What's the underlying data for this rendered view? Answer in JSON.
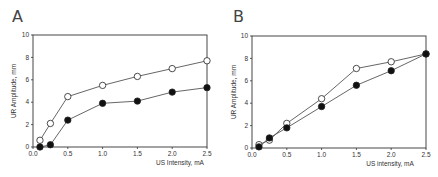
{
  "chart_data": [
    {
      "panel": "A",
      "type": "line",
      "xlabel": "US Intensity, mA",
      "ylabel": "UR Amplitude, mm",
      "xlim": [
        0,
        2.5
      ],
      "ylim": [
        0,
        10
      ],
      "xticks": [
        "0.0",
        "0.5",
        "1.0",
        "1.5",
        "2.0",
        "2.5"
      ],
      "yticks": [
        "0",
        "2",
        "4",
        "6",
        "8",
        "10"
      ],
      "grid": false,
      "x": [
        0.1,
        0.25,
        0.5,
        1.0,
        1.5,
        2.0,
        2.5
      ],
      "series": [
        {
          "name": "open circles",
          "marker": "open",
          "values": [
            0.6,
            2.1,
            4.5,
            5.5,
            6.3,
            7.0,
            7.7
          ]
        },
        {
          "name": "filled circles",
          "marker": "filled",
          "values": [
            0.0,
            0.2,
            2.4,
            3.9,
            4.1,
            4.9,
            5.3
          ]
        }
      ]
    },
    {
      "panel": "B",
      "type": "line",
      "xlabel": "US intensity, mA",
      "ylabel": "UR Amplitude, mm",
      "xlim": [
        0,
        2.5
      ],
      "ylim": [
        0,
        10
      ],
      "xticks": [
        "0.0",
        "0.5",
        "1.0",
        "1.5",
        "2.0",
        "2.5"
      ],
      "yticks": [
        "0",
        "2",
        "4",
        "6",
        "8",
        "10"
      ],
      "grid": false,
      "x": [
        0.1,
        0.25,
        0.5,
        1.0,
        1.5,
        2.0,
        2.5
      ],
      "series": [
        {
          "name": "open circles",
          "marker": "open",
          "values": [
            0.3,
            0.7,
            2.2,
            4.4,
            7.1,
            7.7,
            8.4
          ]
        },
        {
          "name": "filled circles",
          "marker": "filled",
          "values": [
            0.1,
            0.9,
            1.8,
            3.7,
            5.6,
            6.9,
            8.4
          ]
        }
      ]
    }
  ],
  "layout": {
    "panels": [
      {
        "letter_x": 12,
        "letter_y": 22,
        "x0": 33,
        "x1": 207,
        "y0": 147,
        "y1": 35,
        "ylabel_x": 16,
        "xlabel_x": 180,
        "xlabel_y": 165
      },
      {
        "letter_x": 233,
        "letter_y": 22,
        "x0": 252,
        "x1": 426,
        "y0": 148,
        "y1": 36,
        "ylabel_x": 236,
        "xlabel_x": 390,
        "xlabel_y": 166
      }
    ],
    "colors": {
      "axis": "#333333",
      "line": "#555555",
      "marker_stroke": "#222222",
      "filled": "#111111",
      "open": "#ffffff"
    }
  }
}
